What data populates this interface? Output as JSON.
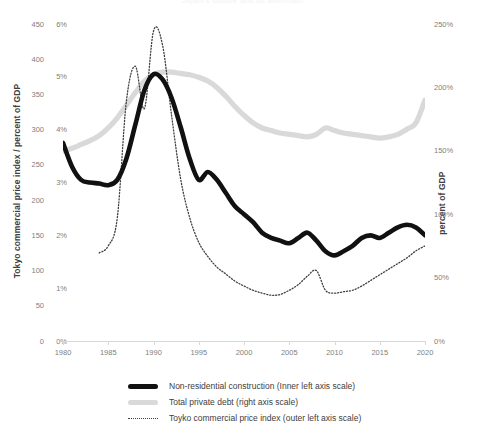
{
  "chart_data": {
    "type": "line",
    "title": "Japan's bubble and its aftermath",
    "xlabel": "",
    "ylabel_left_outer": "Tokyo commercial price index / percent of GDP",
    "ylabel_right": "percent of GDP",
    "grid": false,
    "legend_position": "bottom",
    "x_ticks": [
      "1980",
      "1985",
      "1990",
      "1995",
      "2000",
      "2005",
      "2010",
      "2015",
      "2020"
    ],
    "xlim": [
      1980,
      2020
    ],
    "axes": {
      "left_outer": {
        "name": "Tokyo commercial price index",
        "ticks": [
          "0",
          "50",
          "100",
          "150",
          "200",
          "250",
          "300",
          "350",
          "400",
          "450"
        ],
        "lim": [
          0,
          450
        ]
      },
      "left_inner": {
        "name": "Non-residential construction (percent of GDP)",
        "ticks": [
          "0%",
          "1%",
          "2%",
          "3%",
          "4%",
          "5%",
          "6%"
        ],
        "lim": [
          0,
          6
        ]
      },
      "right": {
        "name": "Total private debt (percent of GDP)",
        "ticks": [
          "0%",
          "50%",
          "100%",
          "150%",
          "200%",
          "250%"
        ],
        "lim": [
          0,
          250
        ]
      }
    },
    "series": [
      {
        "name": "Non-residential construction (Inner left axis scale)",
        "axis": "left_inner",
        "style": "solid-thick",
        "color": "#111111",
        "units": "percent of GDP",
        "x": [
          1980,
          1981,
          1982,
          1983,
          1984,
          1985,
          1986,
          1987,
          1988,
          1989,
          1990,
          1991,
          1992,
          1993,
          1994,
          1995,
          1996,
          1997,
          1998,
          1999,
          2000,
          2001,
          2002,
          2003,
          2004,
          2005,
          2006,
          2007,
          2008,
          2009,
          2010,
          2011,
          2012,
          2013,
          2014,
          2015,
          2016,
          2017,
          2018,
          2019,
          2020
        ],
        "values": [
          3.75,
          3.3,
          3.05,
          3.0,
          2.98,
          2.95,
          3.05,
          3.45,
          4.1,
          4.75,
          5.05,
          4.95,
          4.6,
          4.05,
          3.45,
          3.05,
          3.2,
          3.05,
          2.8,
          2.55,
          2.4,
          2.25,
          2.05,
          1.95,
          1.9,
          1.85,
          1.95,
          2.05,
          1.9,
          1.7,
          1.62,
          1.7,
          1.8,
          1.95,
          2.0,
          1.95,
          2.05,
          2.15,
          2.2,
          2.15,
          2.0
        ]
      },
      {
        "name": "Total private debt (right axis scale)",
        "axis": "right",
        "style": "solid-thick",
        "color": "#d9d9d9",
        "units": "percent of GDP",
        "x": [
          1980,
          1981,
          1982,
          1983,
          1984,
          1985,
          1986,
          1987,
          1988,
          1989,
          1990,
          1991,
          1992,
          1993,
          1994,
          1995,
          1996,
          1997,
          1998,
          1999,
          2000,
          2001,
          2002,
          2003,
          2004,
          2005,
          2006,
          2007,
          2008,
          2009,
          2010,
          2011,
          2012,
          2013,
          2014,
          2015,
          2016,
          2017,
          2018,
          2019,
          2020
        ],
        "values": [
          150,
          152,
          155,
          158,
          162,
          168,
          176,
          186,
          196,
          205,
          210,
          212,
          212,
          211,
          210,
          208,
          205,
          200,
          193,
          185,
          178,
          172,
          168,
          166,
          164,
          163,
          162,
          161,
          163,
          168,
          166,
          164,
          163,
          162,
          161,
          160,
          161,
          163,
          167,
          172,
          190
        ]
      },
      {
        "name": "Toyko commercial price index (outer left axis scale)",
        "axis": "left_outer",
        "style": "dotted-thin",
        "color": "#404040",
        "units": "index",
        "x": [
          1984,
          1985,
          1986,
          1987,
          1988,
          1989,
          1990,
          1991,
          1992,
          1993,
          1994,
          1995,
          1996,
          1997,
          1998,
          1999,
          2000,
          2001,
          2002,
          2003,
          2004,
          2005,
          2006,
          2007,
          2008,
          2009,
          2010,
          2011,
          2012,
          2013,
          2014,
          2015,
          2016,
          2017,
          2018,
          2019,
          2020
        ],
        "values": [
          125,
          135,
          175,
          340,
          390,
          330,
          440,
          420,
          320,
          230,
          175,
          140,
          120,
          105,
          95,
          85,
          78,
          72,
          68,
          65,
          66,
          72,
          80,
          92,
          100,
          72,
          68,
          70,
          72,
          78,
          86,
          94,
          102,
          110,
          118,
          128,
          135
        ]
      }
    ]
  },
  "legend": {
    "items": [
      {
        "label": "Non-residential construction (Inner left axis scale)",
        "marker": "solid-thick-black"
      },
      {
        "label": "Total private debt (right axis scale)",
        "marker": "solid-thick-gray"
      },
      {
        "label": "Toyko commercial price index (outer left axis scale)",
        "marker": "dotted-thin"
      }
    ]
  },
  "colors": {
    "construction": "#111111",
    "debt": "#d9d9d9",
    "price_index": "#404040",
    "axis": "#d9d9d9",
    "tick_text": "#808080",
    "title_text": "#404040"
  }
}
